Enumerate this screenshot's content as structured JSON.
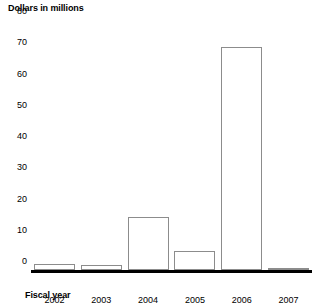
{
  "chart_data": {
    "type": "bar",
    "title": "",
    "xlabel": "Fiscal year",
    "ylabel": "Dollars in millions",
    "categories": [
      "2002",
      "2003",
      "2004",
      "2005",
      "2006",
      "2007"
    ],
    "values": [
      2,
      1.5,
      17,
      6,
      71.5,
      0.3
    ],
    "ylim": [
      0,
      80
    ],
    "ytick_values": [
      0,
      10,
      20,
      30,
      40,
      50,
      60,
      70,
      80
    ],
    "ytick_labels": [
      "0",
      "10",
      "20",
      "30",
      "40",
      "50",
      "60",
      "70",
      "80"
    ],
    "grid": false,
    "legend": "none",
    "series": [
      {
        "name": "Dollars in millions",
        "values": [
          2,
          1.5,
          17,
          6,
          71.5,
          0.3
        ],
        "fill_color": "#ffffff",
        "edge_color": "#8c8c8c"
      }
    ],
    "axis_color": "#000000",
    "background_color": "#ffffff"
  }
}
